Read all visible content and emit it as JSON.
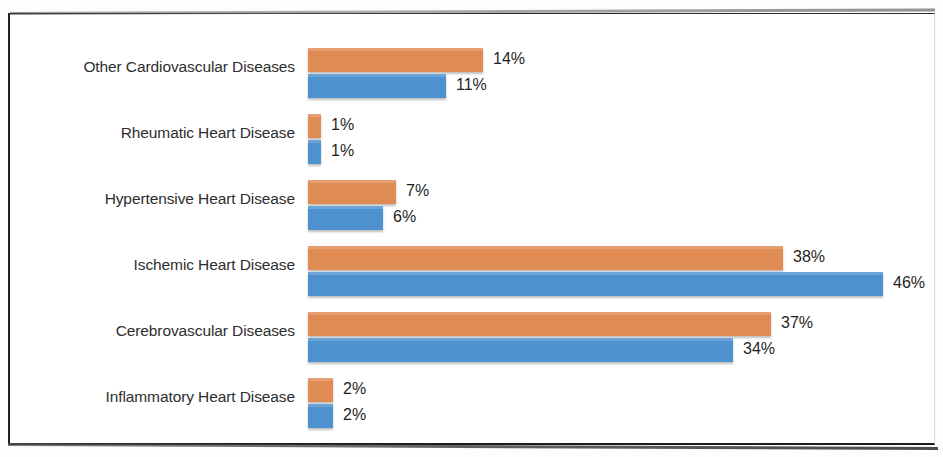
{
  "chart_data": {
    "type": "bar",
    "orientation": "horizontal",
    "title": "",
    "subtitle": "",
    "xlabel": "",
    "ylabel": "",
    "grid": false,
    "legend_visible": false,
    "axis_visible": false,
    "value_suffix": "%",
    "xlim": [
      0,
      50
    ],
    "px_per_unit": 12.5,
    "colors": {
      "series_1": "#e08a54",
      "series_2": "#4d91cf",
      "label_text": "#2e2e2e",
      "value_text": "#1f1f1f",
      "background": "#ffffff",
      "frame": "#222222"
    },
    "categories": [
      "Other Cardiovascular Diseases",
      "Rheumatic Heart Disease",
      "Hypertensive Heart Disease",
      "Ischemic Heart Disease",
      "Cerebrovascular Diseases",
      "Inflammatory Heart Disease"
    ],
    "series": [
      {
        "name": "Series 1",
        "color": "#e08a54",
        "values": [
          14,
          1,
          7,
          38,
          37,
          2
        ],
        "labels": [
          "14%",
          "1%",
          "7%",
          "38%",
          "37%",
          "2%"
        ]
      },
      {
        "name": "Series 2",
        "color": "#4d91cf",
        "values": [
          11,
          1,
          6,
          46,
          34,
          2
        ],
        "labels": [
          "11%",
          "1%",
          "6%",
          "46%",
          "34%",
          "2%"
        ]
      }
    ]
  },
  "groups": [
    {
      "category": "Other Cardiovascular Diseases",
      "orange": {
        "label": "14%",
        "value": 14
      },
      "blue": {
        "label": "11%",
        "value": 11
      }
    },
    {
      "category": "Rheumatic Heart Disease",
      "orange": {
        "label": "1%",
        "value": 1
      },
      "blue": {
        "label": "1%",
        "value": 1
      }
    },
    {
      "category": "Hypertensive Heart Disease",
      "orange": {
        "label": "7%",
        "value": 7
      },
      "blue": {
        "label": "6%",
        "value": 6
      }
    },
    {
      "category": "Ischemic Heart Disease",
      "orange": {
        "label": "38%",
        "value": 38
      },
      "blue": {
        "label": "46%",
        "value": 46
      }
    },
    {
      "category": "Cerebrovascular Diseases",
      "orange": {
        "label": "37%",
        "value": 37
      },
      "blue": {
        "label": "34%",
        "value": 34
      }
    },
    {
      "category": "Inflammatory Heart Disease",
      "orange": {
        "label": "2%",
        "value": 2
      },
      "blue": {
        "label": "2%",
        "value": 2
      }
    }
  ]
}
